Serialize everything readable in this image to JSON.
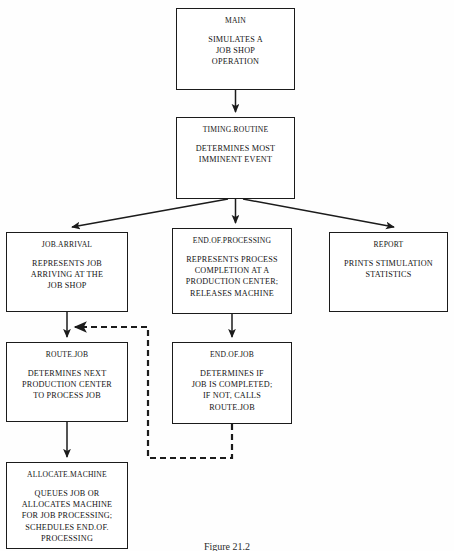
{
  "figure": {
    "caption": "Figure 21.2",
    "caption_left": 0,
    "caption_top": 541
  },
  "style": {
    "line_color": "#1b1b1b",
    "dashed_color": "#1b1b1b",
    "box_fill": "#ffffff",
    "text_color": "#141414"
  },
  "nodes": [
    {
      "id": "main",
      "title": "MAIN",
      "lines": [
        "SIMULATES A",
        "JOB SHOP",
        "OPERATION"
      ],
      "x": 176,
      "y": 8,
      "w": 119,
      "h": 82
    },
    {
      "id": "timing-routine",
      "title": "TIMING.ROUTINE",
      "lines": [
        "DETERMINES MOST",
        "IMMINENT EVENT"
      ],
      "x": 176,
      "y": 117,
      "w": 119,
      "h": 82
    },
    {
      "id": "job-arrival",
      "title": "JOB.ARRIVAL",
      "lines": [
        "REPRESENTS JOB",
        "ARRIVING AT THE",
        "JOB SHOP"
      ],
      "x": 6,
      "y": 232,
      "w": 122,
      "h": 80
    },
    {
      "id": "end-of-processing",
      "title": "END.OF.PROCESSING",
      "lines": [
        "REPRESENTS PROCESS",
        "COMPLETION AT A",
        "PRODUCTION CENTER;",
        "RELEASES MACHINE"
      ],
      "x": 172,
      "y": 228,
      "w": 120,
      "h": 86
    },
    {
      "id": "report",
      "title": "REPORT",
      "lines": [
        "PRINTS STIMULATION",
        "STATISTICS"
      ],
      "x": 329,
      "y": 232,
      "w": 119,
      "h": 80
    },
    {
      "id": "route-job",
      "title": "ROUTE.JOB",
      "lines": [
        "DETERMINES NEXT",
        "PRODUCTION CENTER",
        "TO PROCESS JOB"
      ],
      "x": 6,
      "y": 342,
      "w": 122,
      "h": 80
    },
    {
      "id": "end-of-job",
      "title": "END.OF.JOB",
      "lines": [
        "DETERMINES IF",
        "JOB IS COMPLETED;",
        "IF NOT, CALLS",
        "ROUTE.JOB"
      ],
      "x": 172,
      "y": 342,
      "w": 120,
      "h": 82
    },
    {
      "id": "allocate-machine",
      "title": "ALLOCATE.MACHINE",
      "lines": [
        "QUEUES JOB OR",
        "ALLOCATES MACHINE",
        "FOR JOB PROCESSING;",
        "SCHEDULES END.OF.",
        "PROCESSING"
      ],
      "x": 6,
      "y": 462,
      "w": 122,
      "h": 87
    }
  ],
  "edges": [
    {
      "name": "main-to-timing",
      "from": "main",
      "to": "timing-routine",
      "style": "solid",
      "path": "M 235.5 90 L 235.5 112"
    },
    {
      "name": "timing-to-job-arrival",
      "from": "timing-routine",
      "to": "job-arrival",
      "style": "solid",
      "path": "M 228 199 L 72 227"
    },
    {
      "name": "timing-to-end-of-processing",
      "from": "timing-routine",
      "to": "end-of-processing",
      "style": "solid",
      "path": "M 235.5 199 L 235.5 223"
    },
    {
      "name": "timing-to-report",
      "from": "timing-routine",
      "to": "report",
      "style": "solid",
      "path": "M 243 199 L 394 227"
    },
    {
      "name": "job-arrival-to-route-job",
      "from": "job-arrival",
      "to": "route-job",
      "style": "solid",
      "path": "M 67 312 L 67 337"
    },
    {
      "name": "end-of-processing-to-end-of-job",
      "from": "end-of-processing",
      "to": "end-of-job",
      "style": "solid",
      "path": "M 232 314 L 232 337"
    },
    {
      "name": "route-job-to-allocate-machine",
      "from": "route-job",
      "to": "allocate-machine",
      "style": "solid",
      "path": "M 67 422 L 67 457"
    },
    {
      "name": "end-of-job-to-route-job-feedback",
      "from": "end-of-job",
      "to": "route-job",
      "style": "dashed",
      "path": "M 232 424 L 232 458 L 148 458 L 148 327 L 75 327"
    }
  ]
}
